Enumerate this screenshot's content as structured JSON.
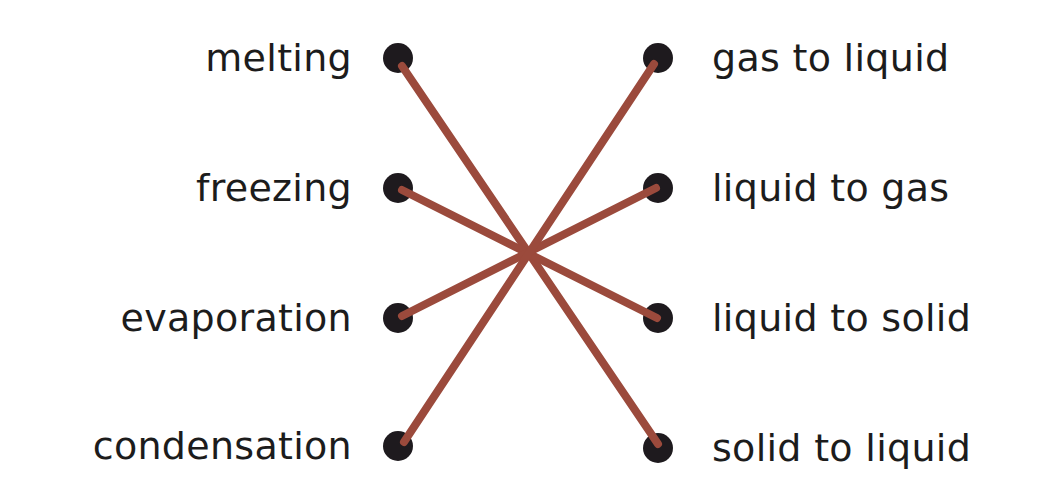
{
  "colors": {
    "line": "#9b4a3c",
    "dot": "#1e1a1e",
    "text": "#1c1c1c"
  },
  "left_items": [
    {
      "label": "melting",
      "y": 58
    },
    {
      "label": "freezing",
      "y": 188
    },
    {
      "label": "evaporation",
      "y": 318
    },
    {
      "label": "condensation",
      "y": 446
    }
  ],
  "right_items": [
    {
      "label": "gas to liquid",
      "y": 58
    },
    {
      "label": "liquid to gas",
      "y": 188
    },
    {
      "label": "liquid to solid",
      "y": 318
    },
    {
      "label": "solid to liquid",
      "y": 448
    }
  ],
  "connections": [
    {
      "from": "melting",
      "to": "solid to liquid"
    },
    {
      "from": "freezing",
      "to": "liquid to solid"
    },
    {
      "from": "evaporation",
      "to": "liquid to gas"
    },
    {
      "from": "condensation",
      "to": "gas to liquid"
    }
  ]
}
